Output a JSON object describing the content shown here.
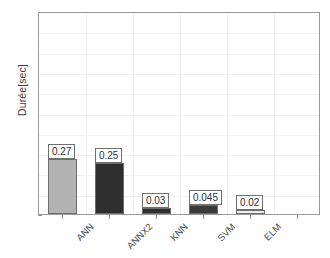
{
  "chart_data": {
    "type": "bar",
    "title": "",
    "xlabel": "",
    "ylabel": "Durée[sec]",
    "categories": [
      "ANN",
      "ANNX2",
      "KNN",
      "SVM",
      "ELM"
    ],
    "values": [
      0.27,
      0.25,
      0.03,
      0.045,
      0.02
    ],
    "value_labels": [
      "0.27",
      "0.25",
      "0.03",
      "0.045",
      "0.02"
    ],
    "ylim": [
      0,
      1
    ],
    "ytick_labels": [
      "0",
      "0.1",
      "0.2",
      "0.3",
      "0.4",
      "0.5",
      "0.6",
      "0.7",
      "0.8",
      "0.9",
      "1"
    ],
    "ytick_values": [
      0,
      0.1,
      0.2,
      0.3,
      0.4,
      0.5,
      0.6,
      0.7,
      0.8,
      0.9,
      1
    ],
    "grid": true,
    "legend": "none",
    "bar_colors": [
      "#b3b3b3",
      "#2e2e2e",
      "#2e2e2e",
      "#3a3a3a",
      "#f0f0f0"
    ],
    "axis_color": "#9a9a9a",
    "grid_color": "#f2f2f2",
    "background": "#ffffff"
  }
}
